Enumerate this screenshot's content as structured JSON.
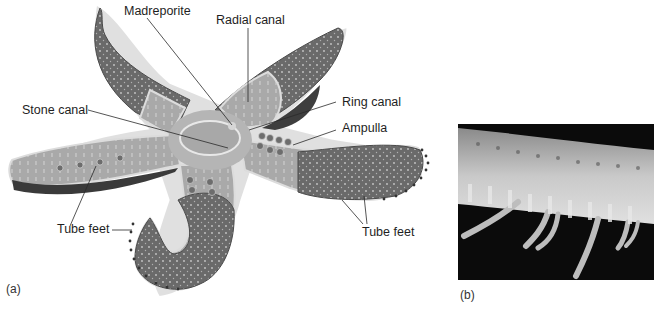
{
  "figure": {
    "panel_a": {
      "panel_label": "(a)",
      "subject": "starfish water vascular system illustration",
      "labels": {
        "madreporite": "Madreporite",
        "radial_canal": "Radial canal",
        "stone_canal": "Stone canal",
        "ring_canal": "Ring canal",
        "ampulla": "Ampulla",
        "tube_feet_left": "Tube feet",
        "tube_feet_right": "Tube feet"
      }
    },
    "panel_b": {
      "panel_label": "(b)",
      "subject": "photograph of starfish arm underside showing tube feet"
    },
    "colors": {
      "arm_dark": "#5a5a5a",
      "arm_mid": "#8a8a8a",
      "cutaway_light": "#b8b8b8",
      "outline": "#cfcfcf",
      "photo_bg": "#0b0b0b",
      "leader_line": "#2a2a2a"
    }
  }
}
